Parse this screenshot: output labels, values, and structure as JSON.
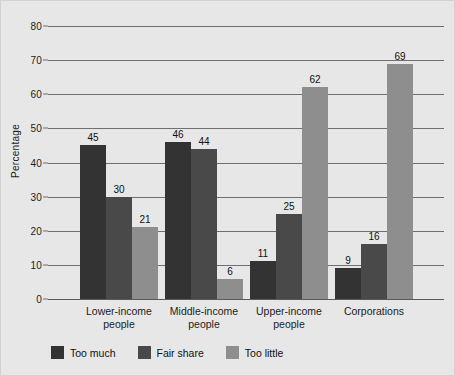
{
  "chart_data": {
    "type": "bar",
    "title": "",
    "subtitle": "",
    "xlabel": "",
    "ylabel": "Percentage",
    "ylim": [
      0,
      80
    ],
    "yticks": [
      0,
      10,
      20,
      30,
      40,
      50,
      60,
      70,
      80
    ],
    "ytick_labels": [
      "0",
      "10",
      "20",
      "30",
      "40",
      "50",
      "60",
      "70",
      "80"
    ],
    "grid": "horizontal",
    "legend_position": "bottom-left",
    "categories": [
      {
        "line1": "Lower-income",
        "line2": "people"
      },
      {
        "line1": "Middle-income",
        "line2": "people"
      },
      {
        "line1": "Upper-income",
        "line2": "people"
      },
      {
        "line1": "Corporations",
        "line2": ""
      }
    ],
    "series": [
      {
        "name": "Too much",
        "color": "#333333",
        "values": [
          45,
          46,
          11,
          9
        ]
      },
      {
        "name": "Fair share",
        "color": "#494949",
        "values": [
          30,
          44,
          25,
          16
        ]
      },
      {
        "name": "Too little",
        "color": "#8e8e8e",
        "values": [
          21,
          6,
          62,
          69
        ]
      }
    ],
    "value_labels": {
      "Lower-income people": [
        "45",
        "30",
        "21"
      ],
      "Middle-income people": [
        "46",
        "44",
        "6"
      ],
      "Upper-income people": [
        "11",
        "25",
        "62"
      ],
      "Corporations": [
        "9",
        "16",
        "69"
      ]
    }
  },
  "colors": {
    "background": "#e7e7e7",
    "border": "#d2d2d2",
    "gridline": "#6f6f6f",
    "text": "#1c1c1c",
    "series_too_much": "#333333",
    "series_fair_share": "#494949",
    "series_too_little": "#8e8e8e"
  }
}
